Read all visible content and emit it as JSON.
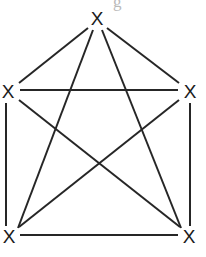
{
  "figure": {
    "name": "complete-graph-k5",
    "title": "",
    "background_color": "#ffffff",
    "edge_color": "#262626",
    "edge_width": 2,
    "label_color": "#1b1b1b",
    "width": 206,
    "height": 257
  },
  "artifact": {
    "text": "g",
    "color": "#b9b9b9"
  },
  "vertices": [
    {
      "id": "top",
      "label": "X",
      "x": 97,
      "y": 18
    },
    {
      "id": "left-middle",
      "label": "X",
      "x": 8,
      "y": 91
    },
    {
      "id": "right-middle",
      "label": "X",
      "x": 190,
      "y": 91
    },
    {
      "id": "bottom-left",
      "label": "X",
      "x": 9,
      "y": 236
    },
    {
      "id": "bottom-right",
      "label": "X",
      "x": 189,
      "y": 236
    }
  ],
  "edges": [
    {
      "id": "top--left-middle",
      "from": "top",
      "to": "left-middle",
      "x1": 88,
      "y1": 28,
      "x2": 19,
      "y2": 83
    },
    {
      "id": "top--right-middle",
      "from": "top",
      "to": "right-middle",
      "x1": 107,
      "y1": 28,
      "x2": 179,
      "y2": 83
    },
    {
      "id": "top--bottom-left",
      "from": "top",
      "to": "bottom-left",
      "x1": 93,
      "y1": 30,
      "x2": 18,
      "y2": 228
    },
    {
      "id": "top--bottom-right",
      "from": "top",
      "to": "bottom-right",
      "x1": 102,
      "y1": 30,
      "x2": 181,
      "y2": 228
    },
    {
      "id": "left-middle--right-middle",
      "from": "left-middle",
      "to": "right-middle",
      "x1": 20,
      "y1": 90,
      "x2": 178,
      "y2": 90
    },
    {
      "id": "left-middle--bottom-left",
      "from": "left-middle",
      "to": "bottom-left",
      "x1": 6,
      "y1": 103,
      "x2": 6,
      "y2": 226
    },
    {
      "id": "left-middle--bottom-right",
      "from": "left-middle",
      "to": "bottom-right",
      "x1": 19,
      "y1": 100,
      "x2": 180,
      "y2": 227
    },
    {
      "id": "right-middle--bottom-right",
      "from": "right-middle",
      "to": "bottom-right",
      "x1": 190,
      "y1": 103,
      "x2": 190,
      "y2": 226
    },
    {
      "id": "right-middle--bottom-left",
      "from": "right-middle",
      "to": "bottom-left",
      "x1": 179,
      "y1": 100,
      "x2": 19,
      "y2": 227
    },
    {
      "id": "bottom-left--bottom-right",
      "from": "bottom-left",
      "to": "bottom-right",
      "x1": 20,
      "y1": 235,
      "x2": 178,
      "y2": 235
    }
  ]
}
